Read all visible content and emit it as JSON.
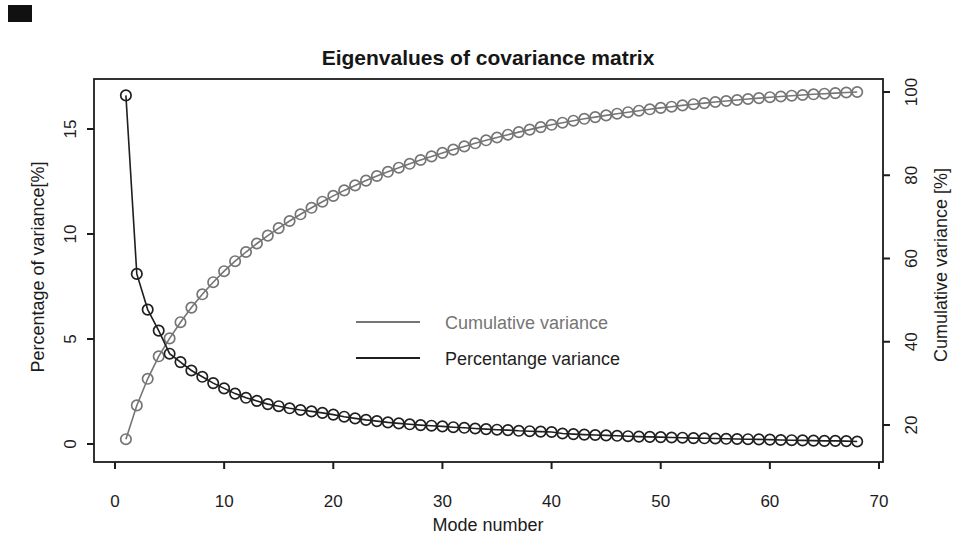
{
  "figure": {
    "background_color": "#ffffff",
    "axis_color": "#1c1c1c",
    "has_scan_artifact_top_left": true
  },
  "chart_data": {
    "type": "line",
    "title": "Eigenvalues of covariance matrix",
    "xlabel": "Mode number",
    "ylabel_left": "Percentage of variance[%]",
    "ylabel_right": "Cumulative variance [%]",
    "x_ticks": [
      0,
      10,
      20,
      30,
      40,
      50,
      60,
      70
    ],
    "y_left_ticks": [
      0,
      5,
      10,
      15
    ],
    "y_right_ticks": [
      20,
      40,
      60,
      80,
      100
    ],
    "x_range": [
      0,
      70
    ],
    "y_left_range": [
      0,
      15
    ],
    "y_right_range": [
      20,
      100
    ],
    "grid": false,
    "marker": "open-circle",
    "legend_position": "center",
    "x": [
      1,
      2,
      3,
      4,
      5,
      6,
      7,
      8,
      9,
      10,
      11,
      12,
      13,
      14,
      15,
      16,
      17,
      18,
      19,
      20,
      21,
      22,
      23,
      24,
      25,
      26,
      27,
      28,
      29,
      30,
      31,
      32,
      33,
      34,
      35,
      36,
      37,
      38,
      39,
      40,
      41,
      42,
      43,
      44,
      45,
      46,
      47,
      48,
      49,
      50,
      51,
      52,
      53,
      54,
      55,
      56,
      57,
      58,
      59,
      60,
      61,
      62,
      63,
      64,
      65,
      66,
      67,
      68
    ],
    "series": [
      {
        "name": "Cumulative variance",
        "axis": "right",
        "color": "#757575",
        "values": [
          16.6,
          24.7,
          31.1,
          36.5,
          40.8,
          44.7,
          48.2,
          51.4,
          54.3,
          56.95,
          59.35,
          61.55,
          63.6,
          65.5,
          67.3,
          69.0,
          70.62,
          72.17,
          73.65,
          75.05,
          76.35,
          77.57,
          78.72,
          79.81,
          80.84,
          81.82,
          82.76,
          83.66,
          84.53,
          85.37,
          86.17,
          86.94,
          87.68,
          88.39,
          89.07,
          89.73,
          90.36,
          90.97,
          91.56,
          92.13,
          92.63,
          93.1,
          93.55,
          93.98,
          94.39,
          94.78,
          95.15,
          95.5,
          95.84,
          96.17,
          96.48,
          96.78,
          97.06,
          97.33,
          97.59,
          97.84,
          98.08,
          98.31,
          98.53,
          98.74,
          98.93,
          99.11,
          99.28,
          99.44,
          99.59,
          99.74,
          99.88,
          100.0
        ]
      },
      {
        "name": "Percentange variance",
        "axis": "left",
        "color": "#1f1f1f",
        "values": [
          16.6,
          8.1,
          6.4,
          5.4,
          4.3,
          3.9,
          3.5,
          3.2,
          2.9,
          2.65,
          2.4,
          2.2,
          2.05,
          1.9,
          1.8,
          1.7,
          1.62,
          1.55,
          1.48,
          1.4,
          1.3,
          1.22,
          1.15,
          1.09,
          1.03,
          0.98,
          0.94,
          0.9,
          0.87,
          0.84,
          0.8,
          0.77,
          0.74,
          0.71,
          0.68,
          0.66,
          0.63,
          0.61,
          0.59,
          0.57,
          0.5,
          0.47,
          0.45,
          0.43,
          0.41,
          0.39,
          0.37,
          0.35,
          0.34,
          0.33,
          0.31,
          0.3,
          0.28,
          0.27,
          0.26,
          0.25,
          0.24,
          0.23,
          0.22,
          0.21,
          0.19,
          0.18,
          0.17,
          0.16,
          0.15,
          0.15,
          0.14,
          0.12
        ]
      }
    ]
  }
}
